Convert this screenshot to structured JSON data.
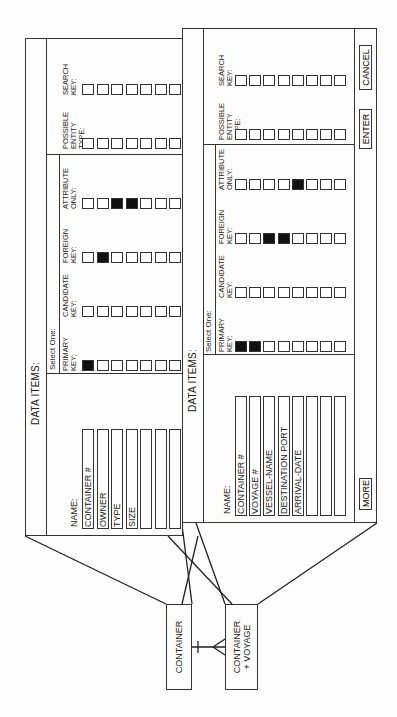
{
  "entities": [
    {
      "id": "container",
      "label": "CONTAINER"
    },
    {
      "id": "container_voyage",
      "label_line1": "CONTAINER",
      "label_line2": "+ VOYAGE"
    }
  ],
  "relationship": {
    "from": "CONTAINER",
    "to": "CONTAINER + VOYAGE",
    "cardinality": "one-to-many"
  },
  "panel_back": {
    "title": "DATA ITEMS:",
    "select_one_label": "Select One:",
    "name_header": "NAME:",
    "columns": [
      {
        "label": "PRIMARY\nKEY:",
        "checked": [
          0
        ]
      },
      {
        "label": "CANDIDATE\nKEY:",
        "checked": []
      },
      {
        "label": "FOREIGN\nKEY:",
        "checked": [
          1
        ]
      },
      {
        "label": "ATTRIBUTE\nONLY:",
        "checked": [
          2,
          3
        ]
      }
    ],
    "extra_columns": [
      {
        "label": "POSSIBLE\nENTITY\nTYPE:",
        "checked": []
      },
      {
        "label": "SEARCH\nKEY:",
        "checked": []
      }
    ],
    "rows": [
      "CONTAINER #",
      "OWNER",
      "TYPE",
      "SIZE",
      "",
      "",
      ""
    ]
  },
  "panel_front": {
    "title": "DATA ITEMS:",
    "select_one_label": "Select One:",
    "name_header": "NAME:",
    "columns": [
      {
        "label": "PRIMARY\nKEY:",
        "checked": [
          0,
          1
        ]
      },
      {
        "label": "CANDIDATE\nKEY:",
        "checked": []
      },
      {
        "label": "FOREIGN\nKEY:",
        "checked": [
          2,
          3
        ]
      },
      {
        "label": "ATTRIBUTE\nONLY:",
        "checked": [
          4
        ]
      }
    ],
    "extra_columns": [
      {
        "label": "POSSIBLE\nENTITY\nTYPE:",
        "checked": []
      },
      {
        "label": "SEARCH\nKEY:",
        "checked": []
      }
    ],
    "rows": [
      "CONTAINER #",
      "VOYAGE #",
      "VESSEL-NAME",
      "DESTINATION PORT",
      "ARRIVAL-DATE",
      "",
      "",
      ""
    ],
    "buttons": {
      "more": "MORE",
      "enter": "ENTER",
      "cancel": "CANCEL"
    }
  },
  "colors": {
    "line": "#333333",
    "checked": "#111111",
    "background": "#fdfdfb"
  }
}
